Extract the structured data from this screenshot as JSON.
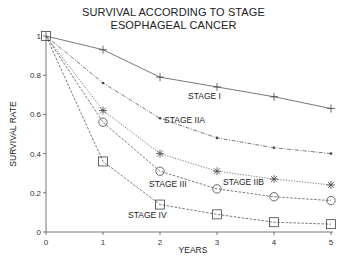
{
  "chart_data": {
    "type": "line",
    "title": "SURVIVAL ACCORDING TO STAGE",
    "subtitle": "ESOPHAGEAL CANCER",
    "xlabel": "YEARS",
    "ylabel": "SURVIVAL RATE",
    "x": [
      0,
      1,
      2,
      3,
      4,
      5
    ],
    "xticks": [
      "0",
      "1",
      "2",
      "3",
      "4",
      "5"
    ],
    "yticks": [
      "0",
      "0.2",
      "0.4",
      "0.6",
      "0.8",
      "1"
    ],
    "xlim": [
      0,
      5
    ],
    "ylim": [
      0,
      1
    ],
    "grid": false,
    "legend": "inline labels",
    "series": [
      {
        "name": "STAGE I",
        "marker": "plus",
        "style": "solid",
        "values": [
          1.0,
          0.93,
          0.79,
          0.74,
          0.69,
          0.63
        ]
      },
      {
        "name": "STAGE IIA",
        "marker": "dot",
        "style": "dashdot",
        "values": [
          1.0,
          0.76,
          0.58,
          0.48,
          0.43,
          0.4
        ]
      },
      {
        "name": "STAGE IIB",
        "marker": "asterisk",
        "style": "dotted",
        "values": [
          1.0,
          0.62,
          0.4,
          0.31,
          0.27,
          0.24
        ]
      },
      {
        "name": "STAGE III",
        "marker": "circle",
        "style": "dashed",
        "values": [
          1.0,
          0.56,
          0.31,
          0.22,
          0.18,
          0.16
        ]
      },
      {
        "name": "STAGE IV",
        "marker": "square",
        "style": "dashed",
        "values": [
          1.0,
          0.36,
          0.14,
          0.09,
          0.05,
          0.04
        ]
      }
    ]
  },
  "header": {
    "title_line1": "SURVIVAL ACCORDING TO STAGE",
    "title_line2": "ESOPHAGEAL CANCER"
  },
  "axes": {
    "xlabel": "YEARS",
    "ylabel": "SURVIVAL RATE"
  },
  "labels": {
    "stage1": "STAGE I",
    "stage2a": "STAGE IIA",
    "stage2b": "STAGE IIB",
    "stage3": "STAGE III",
    "stage4": "STAGE IV"
  }
}
